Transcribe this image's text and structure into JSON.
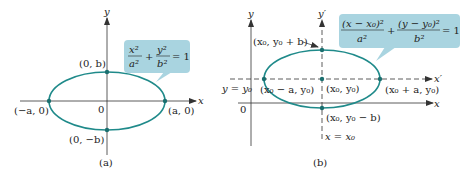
{
  "figure_a": {
    "caption": "(a)",
    "axis_x": "x",
    "axis_y": "y",
    "origin": "0",
    "equation": {
      "term1_num": "x²",
      "term1_den": "a²",
      "plus": "+",
      "term2_num": "y²",
      "term2_den": "b²",
      "rhs": "= 1"
    },
    "points": {
      "top": "(0, b)",
      "bottom": "(0, −b)",
      "left": "(−a, 0)",
      "right": "(a, 0)"
    }
  },
  "figure_b": {
    "caption": "(b)",
    "axis_x": "x",
    "axis_y": "y",
    "axis_x_prime": "x′",
    "axis_y_prime": "y′",
    "origin": "0",
    "line_y": "y = y₀",
    "line_x": "x = x₀",
    "equation": {
      "term1_num": "(x − x₀)²",
      "term1_den": "a²",
      "plus": "+",
      "term2_num": "(y − y₀)²",
      "term2_den": "b²",
      "rhs": "= 1"
    },
    "points": {
      "top": "(x₀, y₀ + b)",
      "center": "(x₀, y₀)",
      "bottom": "(x₀, y₀ − b)",
      "left": "(x₀ − a, y₀)",
      "right": "(x₀ + a, y₀)"
    }
  },
  "colors": {
    "ellipse": "#1f8a8a",
    "callout": "#a9d4e0",
    "axis": "#333333"
  }
}
